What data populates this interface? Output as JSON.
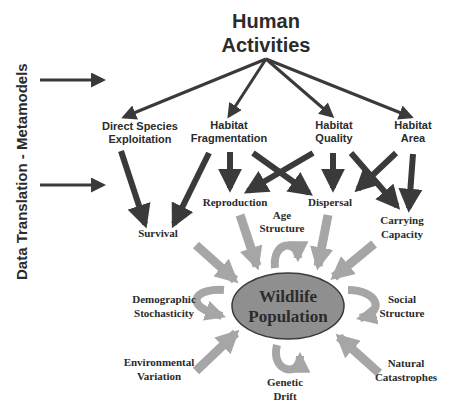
{
  "diagram": {
    "side_label": "Data Translation - Metamodels",
    "root": {
      "line1": "Human",
      "line2": "Activities"
    },
    "drivers": [
      {
        "id": "direct",
        "line1": "Direct Species",
        "line2": "Exploitation"
      },
      {
        "id": "fragmentation",
        "line1": "Habitat",
        "line2": "Fragmentation"
      },
      {
        "id": "quality",
        "line1": "Habitat",
        "line2": "Quality"
      },
      {
        "id": "area",
        "line1": "Habitat",
        "line2": "Area"
      }
    ],
    "vital_rates": [
      {
        "id": "survival",
        "label": "Survival"
      },
      {
        "id": "reproduction",
        "label": "Reproduction"
      },
      {
        "id": "dispersal",
        "label": "Dispersal"
      },
      {
        "id": "capacity",
        "line1": "Carrying",
        "line2": "Capacity"
      }
    ],
    "center": {
      "line1": "Wildlife",
      "line2": "Population"
    },
    "population_factors": [
      {
        "id": "age",
        "line1": "Age",
        "line2": "Structure"
      },
      {
        "id": "demographic",
        "line1": "Demographic",
        "line2": "Stochasticity"
      },
      {
        "id": "social",
        "line1": "Social",
        "line2": "Structure"
      },
      {
        "id": "environmental",
        "line1": "Environmental",
        "line2": "Variation"
      },
      {
        "id": "genetic",
        "line1": "Genetic",
        "line2": "Drift"
      },
      {
        "id": "catastrophes",
        "line1": "Natural",
        "line2": "Catastrophes"
      }
    ],
    "colors": {
      "dark_arrow": "#3a3a3a",
      "gray_arrow": "#a6a6a6",
      "ellipse_fill": "#8f8f8f",
      "ellipse_stroke": "#3a3a3a",
      "text": "#2b2b2b"
    }
  }
}
